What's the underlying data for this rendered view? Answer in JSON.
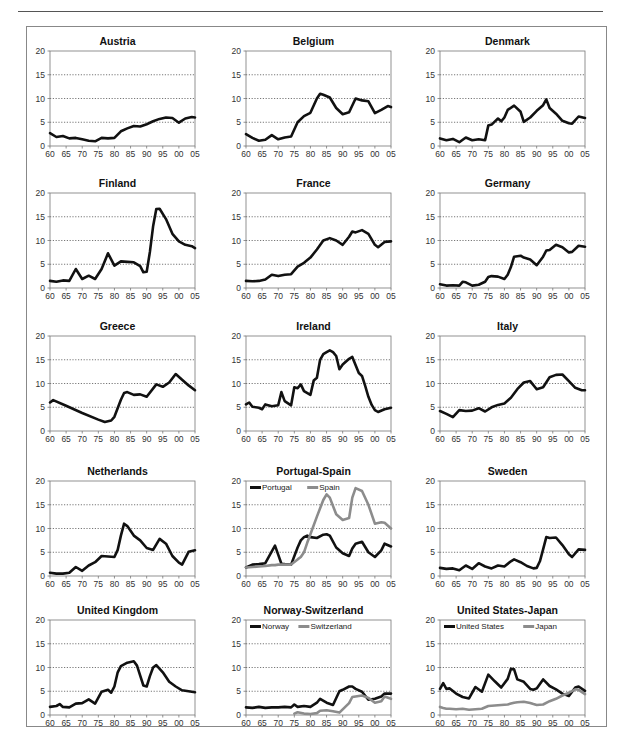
{
  "figure": {
    "y_ticks": [
      0,
      5,
      10,
      15,
      20
    ],
    "x_ticks": [
      "60",
      "65",
      "70",
      "75",
      "80",
      "85",
      "90",
      "95",
      "00",
      "05"
    ],
    "colors": {
      "primary": "#111111",
      "secondary": "#8c8c8c",
      "grid": "#555555",
      "axis": "#777777"
    }
  },
  "chart_data": [
    {
      "type": "line",
      "title": "Austria",
      "xlabel": "",
      "ylabel": "",
      "ylim": [
        0,
        20
      ],
      "xlim": [
        1960,
        2005
      ],
      "grid": "horizontal dotted at 5,10,15",
      "legend": "none",
      "x": [
        1960,
        1962,
        1964,
        1966,
        1968,
        1970,
        1972,
        1974,
        1976,
        1978,
        1980,
        1982,
        1984,
        1986,
        1988,
        1990,
        1992,
        1994,
        1996,
        1998,
        2000,
        2002,
        2004,
        2005
      ],
      "series": [
        {
          "name": "Austria",
          "values": [
            2.7,
            1.9,
            2.1,
            1.6,
            1.7,
            1.4,
            1.1,
            1.0,
            1.7,
            1.6,
            1.7,
            3.1,
            3.7,
            4.2,
            4.1,
            4.6,
            5.2,
            5.7,
            6.0,
            5.9,
            4.9,
            5.8,
            6.1,
            6.0
          ]
        }
      ]
    },
    {
      "type": "line",
      "title": "Belgium",
      "ylim": [
        0,
        20
      ],
      "xlim": [
        1960,
        2005
      ],
      "legend": "none",
      "x": [
        1960,
        1962,
        1964,
        1966,
        1968,
        1970,
        1972,
        1974,
        1976,
        1978,
        1980,
        1982,
        1983,
        1984,
        1986,
        1988,
        1990,
        1992,
        1994,
        1996,
        1998,
        2000,
        2002,
        2004,
        2005
      ],
      "series": [
        {
          "name": "Belgium",
          "values": [
            2.5,
            1.7,
            1.1,
            1.3,
            2.3,
            1.4,
            1.8,
            2.0,
            5.0,
            6.3,
            7.0,
            10.0,
            11.0,
            10.8,
            10.2,
            8.0,
            6.7,
            7.1,
            10.0,
            9.6,
            9.4,
            6.9,
            7.6,
            8.4,
            8.2
          ]
        }
      ]
    },
    {
      "type": "line",
      "title": "Denmark",
      "ylim": [
        0,
        20
      ],
      "xlim": [
        1960,
        2005
      ],
      "legend": "none",
      "x": [
        1960,
        1962,
        1964,
        1966,
        1968,
        1970,
        1972,
        1974,
        1975,
        1976,
        1978,
        1979,
        1980,
        1981,
        1983,
        1985,
        1986,
        1988,
        1990,
        1992,
        1993,
        1994,
        1996,
        1998,
        2000,
        2001,
        2003,
        2005
      ],
      "series": [
        {
          "name": "Denmark",
          "values": [
            1.6,
            1.2,
            1.5,
            0.8,
            1.8,
            1.2,
            1.4,
            1.2,
            4.3,
            4.5,
            5.8,
            5.2,
            6.0,
            7.6,
            8.5,
            7.2,
            5.1,
            6.0,
            7.4,
            8.6,
            9.8,
            8.0,
            6.8,
            5.3,
            4.8,
            4.7,
            6.2,
            5.9
          ]
        }
      ]
    },
    {
      "type": "line",
      "title": "Finland",
      "ylim": [
        0,
        20
      ],
      "xlim": [
        1960,
        2005
      ],
      "legend": "none",
      "x": [
        1960,
        1962,
        1964,
        1966,
        1968,
        1970,
        1972,
        1974,
        1976,
        1978,
        1980,
        1982,
        1984,
        1986,
        1988,
        1989,
        1990,
        1991,
        1992,
        1993,
        1994,
        1996,
        1998,
        2000,
        2002,
        2004,
        2005
      ],
      "series": [
        {
          "name": "Finland",
          "values": [
            1.5,
            1.3,
            1.6,
            1.5,
            4.0,
            1.9,
            2.6,
            1.9,
            4.0,
            7.3,
            4.7,
            5.6,
            5.5,
            5.4,
            4.6,
            3.3,
            3.4,
            7.6,
            13.0,
            16.6,
            16.7,
            14.5,
            11.4,
            9.8,
            9.1,
            8.8,
            8.4
          ]
        }
      ]
    },
    {
      "type": "line",
      "title": "France",
      "ylim": [
        0,
        20
      ],
      "xlim": [
        1960,
        2005
      ],
      "legend": "none",
      "x": [
        1960,
        1962,
        1964,
        1966,
        1968,
        1970,
        1972,
        1974,
        1976,
        1978,
        1980,
        1982,
        1984,
        1986,
        1988,
        1990,
        1992,
        1993,
        1994,
        1996,
        1998,
        2000,
        2001,
        2003,
        2005
      ],
      "series": [
        {
          "name": "France",
          "values": [
            1.5,
            1.4,
            1.5,
            1.8,
            2.8,
            2.5,
            2.8,
            2.9,
            4.5,
            5.3,
            6.4,
            8.1,
            10.0,
            10.5,
            10.0,
            9.1,
            10.8,
            11.9,
            11.7,
            12.2,
            11.4,
            9.1,
            8.6,
            9.7,
            9.8
          ]
        }
      ]
    },
    {
      "type": "line",
      "title": "Germany",
      "ylim": [
        0,
        20
      ],
      "xlim": [
        1960,
        2005
      ],
      "legend": "none",
      "x": [
        1960,
        1962,
        1964,
        1966,
        1967,
        1968,
        1970,
        1972,
        1974,
        1975,
        1976,
        1978,
        1980,
        1981,
        1982,
        1983,
        1985,
        1986,
        1988,
        1990,
        1992,
        1993,
        1994,
        1996,
        1998,
        2000,
        2001,
        2003,
        2005
      ],
      "series": [
        {
          "name": "Germany",
          "values": [
            0.8,
            0.5,
            0.6,
            0.5,
            1.3,
            1.2,
            0.5,
            0.7,
            1.3,
            2.3,
            2.5,
            2.4,
            1.9,
            2.8,
            4.4,
            6.6,
            6.8,
            6.4,
            6.0,
            4.8,
            6.6,
            7.9,
            8.0,
            9.1,
            8.6,
            7.5,
            7.6,
            8.9,
            8.7
          ]
        }
      ]
    },
    {
      "type": "line",
      "title": "Greece",
      "ylim": [
        0,
        20
      ],
      "xlim": [
        1960,
        2005
      ],
      "legend": "none",
      "x": [
        1960,
        1961,
        1965,
        1970,
        1975,
        1977,
        1979,
        1980,
        1982,
        1983,
        1984,
        1986,
        1988,
        1990,
        1993,
        1995,
        1997,
        1999,
        2001,
        2003,
        2005
      ],
      "series": [
        {
          "name": "Greece",
          "values": [
            6.0,
            6.5,
            5.3,
            3.8,
            2.4,
            1.9,
            2.2,
            3.0,
            6.6,
            8.0,
            8.2,
            7.6,
            7.7,
            7.2,
            9.8,
            9.3,
            10.2,
            12.0,
            10.8,
            9.6,
            8.6
          ]
        }
      ]
    },
    {
      "type": "line",
      "title": "Ireland",
      "ylim": [
        0,
        20
      ],
      "xlim": [
        1960,
        2005
      ],
      "legend": "none",
      "x": [
        1960,
        1961,
        1962,
        1964,
        1965,
        1966,
        1968,
        1970,
        1971,
        1972,
        1974,
        1975,
        1976,
        1977,
        1978,
        1980,
        1981,
        1982,
        1983,
        1984,
        1985,
        1986,
        1987,
        1988,
        1989,
        1990,
        1992,
        1993,
        1995,
        1996,
        1997,
        1998,
        1999,
        2000,
        2001,
        2003,
        2005
      ],
      "series": [
        {
          "name": "Ireland",
          "values": [
            5.6,
            6.0,
            5.1,
            4.9,
            4.6,
            5.6,
            5.2,
            5.4,
            8.2,
            6.3,
            5.4,
            9.2,
            9.0,
            9.8,
            8.4,
            7.6,
            10.6,
            11.2,
            15.0,
            16.2,
            16.6,
            17.0,
            16.6,
            15.8,
            13.0,
            14.0,
            15.2,
            15.6,
            12.2,
            11.6,
            9.5,
            7.2,
            5.5,
            4.4,
            4.0,
            4.6,
            4.9
          ]
        }
      ]
    },
    {
      "type": "line",
      "title": "Italy",
      "ylim": [
        0,
        20
      ],
      "xlim": [
        1960,
        2005
      ],
      "legend": "none",
      "x": [
        1960,
        1962,
        1964,
        1966,
        1968,
        1970,
        1972,
        1974,
        1976,
        1978,
        1980,
        1982,
        1984,
        1986,
        1988,
        1990,
        1992,
        1994,
        1996,
        1998,
        2000,
        2002,
        2004,
        2005
      ],
      "series": [
        {
          "name": "Italy",
          "values": [
            4.2,
            3.6,
            2.9,
            4.4,
            4.2,
            4.3,
            4.8,
            4.1,
            5.0,
            5.5,
            5.8,
            7.0,
            8.8,
            10.2,
            10.5,
            8.8,
            9.2,
            11.3,
            11.8,
            11.9,
            10.5,
            9.1,
            8.6,
            8.6
          ]
        }
      ]
    },
    {
      "type": "line",
      "title": "Netherlands",
      "ylim": [
        0,
        20
      ],
      "xlim": [
        1960,
        2005
      ],
      "legend": "none",
      "x": [
        1960,
        1962,
        1964,
        1966,
        1968,
        1970,
        1972,
        1974,
        1976,
        1978,
        1980,
        1981,
        1982,
        1983,
        1984,
        1986,
        1988,
        1990,
        1992,
        1994,
        1996,
        1998,
        2000,
        2001,
        2003,
        2005
      ],
      "series": [
        {
          "name": "Netherlands",
          "values": [
            0.7,
            0.5,
            0.5,
            0.7,
            1.9,
            1.1,
            2.2,
            2.9,
            4.2,
            4.1,
            4.0,
            5.5,
            8.5,
            11.0,
            10.5,
            8.5,
            7.5,
            5.9,
            5.5,
            7.8,
            6.8,
            4.2,
            2.8,
            2.4,
            5.1,
            5.4
          ]
        }
      ]
    },
    {
      "type": "line",
      "title": "Portugal-Spain",
      "ylim": [
        0,
        20
      ],
      "xlim": [
        1960,
        2005
      ],
      "legend": "top-left, inside plot",
      "x": [
        1960,
        1962,
        1964,
        1966,
        1968,
        1969,
        1970,
        1971,
        1972,
        1974,
        1976,
        1977,
        1978,
        1979,
        1980,
        1982,
        1984,
        1985,
        1986,
        1988,
        1990,
        1992,
        1993,
        1994,
        1996,
        1998,
        2000,
        2002,
        2003,
        2005
      ],
      "series": [
        {
          "name": "Portugal",
          "values": [
            1.8,
            2.4,
            2.5,
            2.7,
            5.2,
            6.4,
            4.5,
            2.6,
            2.5,
            2.4,
            6.0,
            7.5,
            8.2,
            8.5,
            8.2,
            8.0,
            8.7,
            8.8,
            8.5,
            6.0,
            4.8,
            4.2,
            5.8,
            6.8,
            7.2,
            5.0,
            4.0,
            5.4,
            6.8,
            6.2
          ]
        },
        {
          "name": "Spain",
          "values": [
            1.8,
            1.9,
            2.0,
            2.1,
            2.3,
            2.3,
            2.4,
            2.4,
            2.4,
            2.4,
            3.5,
            4.0,
            5.0,
            7.0,
            8.8,
            12.5,
            16.0,
            17.2,
            16.5,
            13.0,
            11.8,
            12.2,
            16.5,
            18.5,
            17.9,
            15.0,
            11.0,
            11.3,
            11.2,
            10.0
          ]
        }
      ]
    },
    {
      "type": "line",
      "title": "Sweden",
      "ylim": [
        0,
        20
      ],
      "xlim": [
        1960,
        2005
      ],
      "legend": "none",
      "x": [
        1960,
        1962,
        1964,
        1966,
        1968,
        1970,
        1972,
        1974,
        1976,
        1978,
        1980,
        1982,
        1983,
        1985,
        1987,
        1989,
        1990,
        1991,
        1992,
        1993,
        1994,
        1996,
        1998,
        2000,
        2001,
        2003,
        2005
      ],
      "series": [
        {
          "name": "Sweden",
          "values": [
            1.7,
            1.5,
            1.6,
            1.2,
            2.2,
            1.5,
            2.7,
            2.0,
            1.6,
            2.2,
            2.0,
            3.1,
            3.5,
            2.9,
            2.1,
            1.6,
            1.7,
            3.1,
            5.6,
            8.2,
            8.0,
            8.1,
            6.5,
            4.6,
            4.0,
            5.6,
            5.5
          ]
        }
      ]
    },
    {
      "type": "line",
      "title": "United Kingdom",
      "ylim": [
        0,
        20
      ],
      "xlim": [
        1960,
        2005
      ],
      "legend": "none",
      "x": [
        1960,
        1962,
        1963,
        1964,
        1966,
        1968,
        1970,
        1972,
        1974,
        1976,
        1978,
        1979,
        1980,
        1981,
        1982,
        1984,
        1986,
        1987,
        1988,
        1989,
        1990,
        1991,
        1992,
        1993,
        1995,
        1997,
        1999,
        2001,
        2003,
        2005
      ],
      "series": [
        {
          "name": "United Kingdom",
          "values": [
            1.7,
            1.9,
            2.3,
            1.7,
            1.6,
            2.4,
            2.5,
            3.3,
            2.4,
            4.9,
            5.3,
            4.7,
            6.0,
            9.0,
            10.3,
            11.0,
            11.3,
            10.4,
            8.3,
            6.2,
            6.0,
            8.2,
            10.0,
            10.5,
            9.0,
            7.0,
            6.0,
            5.2,
            5.0,
            4.8
          ]
        }
      ]
    },
    {
      "type": "line",
      "title": "Norway-Switzerland",
      "ylim": [
        0,
        20
      ],
      "xlim": [
        1960,
        2005
      ],
      "legend": "top-left, inside plot",
      "x": [
        1960,
        1962,
        1964,
        1966,
        1968,
        1970,
        1972,
        1974,
        1975,
        1976,
        1978,
        1980,
        1982,
        1983,
        1985,
        1987,
        1989,
        1990,
        1992,
        1993,
        1994,
        1996,
        1998,
        2000,
        2002,
        2003,
        2005
      ],
      "series": [
        {
          "name": "Norway",
          "values": [
            1.6,
            1.5,
            1.7,
            1.5,
            1.6,
            1.6,
            1.7,
            1.6,
            2.2,
            1.7,
            1.9,
            1.7,
            2.6,
            3.4,
            2.6,
            2.1,
            5.0,
            5.3,
            6.0,
            6.0,
            5.5,
            4.9,
            3.2,
            3.4,
            3.9,
            4.5,
            4.5
          ]
        },
        {
          "name": "Switzerland",
          "values": [
            null,
            null,
            null,
            null,
            null,
            null,
            null,
            null,
            0.3,
            0.6,
            0.3,
            0.2,
            0.4,
            0.9,
            1.0,
            0.8,
            0.5,
            1.2,
            2.5,
            3.8,
            3.9,
            4.1,
            3.6,
            2.6,
            2.9,
            3.9,
            3.4
          ]
        }
      ]
    },
    {
      "type": "line",
      "title": "United States-Japan",
      "ylim": [
        0,
        20
      ],
      "xlim": [
        1960,
        2005
      ],
      "legend": "top-left, inside plot",
      "x": [
        1960,
        1961,
        1962,
        1963,
        1965,
        1967,
        1969,
        1971,
        1973,
        1975,
        1977,
        1979,
        1981,
        1982,
        1983,
        1984,
        1986,
        1988,
        1989,
        1990,
        1992,
        1994,
        1996,
        1998,
        2000,
        2002,
        2003,
        2005
      ],
      "series": [
        {
          "name": "United States",
          "values": [
            5.5,
            6.7,
            5.5,
            5.6,
            4.5,
            3.8,
            3.5,
            5.9,
            4.9,
            8.5,
            7.1,
            5.8,
            7.6,
            9.7,
            9.6,
            7.5,
            7.0,
            5.5,
            5.3,
            5.6,
            7.5,
            6.1,
            5.4,
            4.5,
            4.0,
            5.8,
            6.0,
            5.1
          ]
        },
        {
          "name": "Japan",
          "values": [
            1.7,
            1.5,
            1.3,
            1.3,
            1.2,
            1.3,
            1.1,
            1.2,
            1.3,
            1.9,
            2.0,
            2.1,
            2.2,
            2.4,
            2.6,
            2.7,
            2.8,
            2.5,
            2.3,
            2.1,
            2.2,
            2.9,
            3.4,
            4.1,
            4.7,
            5.4,
            5.3,
            4.4
          ]
        }
      ]
    }
  ]
}
